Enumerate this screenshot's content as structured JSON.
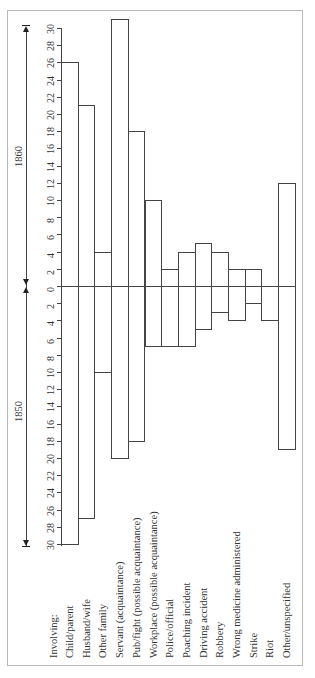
{
  "chart_data": {
    "type": "bar",
    "orientation": "rotated 90° counter-clockwise (back-to-back horizontal bars)",
    "title": "",
    "header_label": "Involving:",
    "series": [
      {
        "name": "1850",
        "values": [
          30,
          27,
          10,
          20,
          18,
          7,
          7,
          7,
          5,
          3,
          4,
          2,
          4,
          19
        ]
      },
      {
        "name": "1860",
        "values": [
          26,
          21,
          4,
          31,
          18,
          10,
          2,
          4,
          5,
          4,
          2,
          2,
          0,
          12
        ]
      }
    ],
    "categories": [
      "Child/parent",
      "Husband/wife",
      "Other family",
      "Servant (acquaintance)",
      "Pub/fight (possible acquaintance)",
      "Workplace (possible acquaintance)",
      "Police/official",
      "Poaching incident",
      "Driving accident",
      "Robbery",
      "Wrong medicine administered",
      "Strike",
      "Riot",
      "Other/unspecified"
    ],
    "axis": {
      "ticks_1860": [
        "0",
        "2",
        "4",
        "6",
        "8",
        "10",
        "12",
        "14",
        "16",
        "18",
        "20",
        "22",
        "24",
        "26",
        "28",
        "30"
      ],
      "ticks_1850": [
        "2",
        "4",
        "6",
        "8",
        "10",
        "12",
        "14",
        "16",
        "18",
        "20",
        "22",
        "24",
        "26",
        "28",
        "30"
      ],
      "range": [
        0,
        30
      ]
    },
    "legend": {
      "left": "1850",
      "right": "1860"
    },
    "grid": false
  },
  "labels": {
    "involving": "Involving:",
    "year_1850": "1850",
    "year_1860": "1860"
  }
}
